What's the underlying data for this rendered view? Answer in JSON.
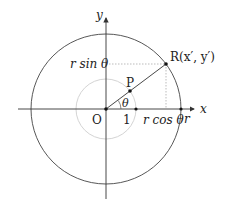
{
  "diagram": {
    "axes": {
      "x_label": "x",
      "y_label": "y"
    },
    "labels": {
      "origin": "O",
      "unit_point": "P",
      "point_R": "R(x′, y′)",
      "angle": "θ",
      "unit_tick": "1",
      "r_tick": "r",
      "r_cos": "r cos θ",
      "r_sin": "r sin θ"
    },
    "geometry": {
      "origin": [
        106,
        109
      ],
      "big_radius": 75,
      "unit_radius": 30,
      "theta_deg": 34
    },
    "colors": {
      "line": "#333333",
      "unit_circle": "#cccccc",
      "dotted": "#aaaaaa"
    }
  }
}
